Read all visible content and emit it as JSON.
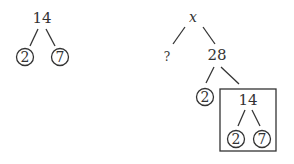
{
  "left_tree": {
    "root": "14",
    "children": [
      "2",
      "7"
    ]
  },
  "right_tree": {
    "root": "x",
    "left_child": "?",
    "right_child": "28",
    "sub_children": [
      "2",
      "14"
    ],
    "boxed_subtree": {
      "root": "14",
      "children": [
        "2",
        "7"
      ]
    }
  },
  "colors": {
    "ink": "#333333",
    "background": "#ffffff"
  }
}
